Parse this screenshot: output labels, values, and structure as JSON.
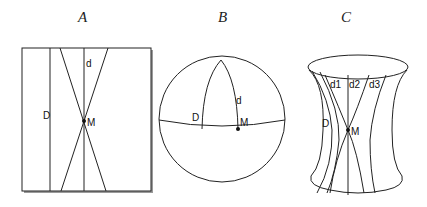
{
  "figure": {
    "panels": [
      {
        "id": "A",
        "title": "A",
        "surface": "flat plane (rectangle)",
        "labels": {
          "line_D": "D",
          "line_d": "d",
          "point": "M"
        }
      },
      {
        "id": "B",
        "title": "B",
        "surface": "sphere",
        "labels": {
          "line_D": "D",
          "line_d": "d",
          "point": "M"
        }
      },
      {
        "id": "C",
        "title": "C",
        "surface": "hyperboloid (saddle-shaped)",
        "labels": {
          "line_D": "D",
          "line_d1": "d1",
          "line_d2": "d2",
          "line_d3": "d3",
          "point": "M"
        }
      }
    ],
    "colors": {
      "stroke": "#222222",
      "shadow": "#9a9a9a",
      "background": "#ffffff"
    }
  }
}
